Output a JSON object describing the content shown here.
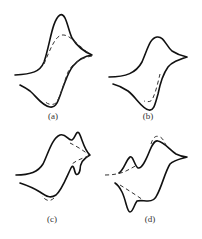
{
  "figure": {
    "colors": {
      "solid": "#111111",
      "dashed": "#333333",
      "background": "#ffffff"
    },
    "panels": [
      {
        "id": "a",
        "label": "(a)"
      },
      {
        "id": "b",
        "label": "(b)"
      },
      {
        "id": "c",
        "label": "(c)"
      },
      {
        "id": "d",
        "label": "(d)"
      }
    ]
  }
}
